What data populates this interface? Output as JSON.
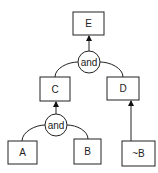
{
  "diagram": {
    "type": "and-tree",
    "nodes": [
      {
        "id": "E",
        "label": "E"
      },
      {
        "id": "C",
        "label": "C"
      },
      {
        "id": "D",
        "label": "D"
      },
      {
        "id": "A",
        "label": "A"
      },
      {
        "id": "B",
        "label": "B"
      },
      {
        "id": "notB",
        "label": "~B"
      }
    ],
    "gates": [
      {
        "id": "and1",
        "label": "and",
        "inputs": [
          "C",
          "D"
        ],
        "output": "E"
      },
      {
        "id": "and2",
        "label": "and",
        "inputs": [
          "A",
          "B"
        ],
        "output": "C"
      }
    ],
    "edges": [
      {
        "from": "notB",
        "to": "D"
      }
    ],
    "colors": {
      "stroke": "#222222",
      "background": "#ffffff"
    }
  }
}
